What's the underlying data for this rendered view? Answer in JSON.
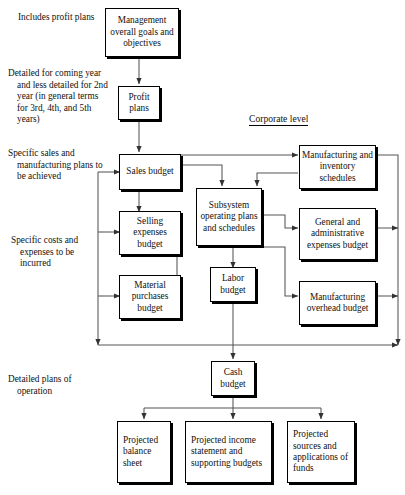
{
  "diagram": {
    "section_label": "Corporate level",
    "side_notes": [
      {
        "id": "note-profit",
        "text": "Includes profit plans"
      },
      {
        "id": "note-detailed",
        "text": "Detailed for coming year and less detailed for 2nd year (in general terms for 3rd, 4th, and 5th years)"
      },
      {
        "id": "note-sales-mfg",
        "text": "Specific sales and manufacturing plans to be achieved"
      },
      {
        "id": "note-costs",
        "text": "Specific costs and expenses to be incurred"
      },
      {
        "id": "note-operations",
        "text": "Detailed plans of operation"
      }
    ],
    "nodes": [
      {
        "id": "management",
        "label": "Management overall goals and objectives"
      },
      {
        "id": "profit-plans",
        "label": "Profit plans"
      },
      {
        "id": "sales-budget",
        "label": "Sales budget"
      },
      {
        "id": "selling-expenses-budget",
        "label": "Selling expenses budget"
      },
      {
        "id": "material-purchases-budget",
        "label": "Material purchases budget"
      },
      {
        "id": "subsystem-operating-plans",
        "label": "Subsystem operating plans and schedules"
      },
      {
        "id": "labor-budget",
        "label": "Labor budget"
      },
      {
        "id": "manufacturing-inventory-schedules",
        "label": "Manufacturing and inventory schedules"
      },
      {
        "id": "general-administrative-expenses-budget",
        "label": "General and administrative expenses budget"
      },
      {
        "id": "manufacturing-overhead-budget",
        "label": "Manufacturing overhead budget"
      },
      {
        "id": "cash-budget",
        "label": "Cash budget"
      },
      {
        "id": "projected-balance-sheet",
        "label": "Projected balance sheet"
      },
      {
        "id": "projected-income-statement",
        "label": "Projected income statement and supporting budgets"
      },
      {
        "id": "projected-sources-applications",
        "label": "Projected sources and applications of funds"
      }
    ],
    "colors": {
      "line": "#555555",
      "border": "#000000",
      "background": "#ffffff"
    }
  }
}
